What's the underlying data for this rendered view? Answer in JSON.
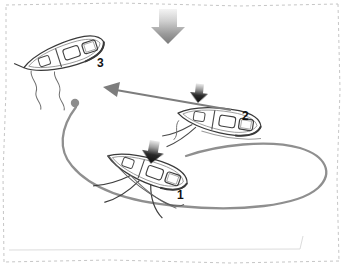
{
  "diagram": {
    "canvas": {
      "width": 344,
      "height": 268,
      "background": "#ffffff"
    },
    "frame": {
      "style": "hand-drawn dashed rectangle",
      "color": "#c9c9c9",
      "dash": "3 3"
    },
    "wind_arrow": {
      "label": "wind-direction",
      "direction": "down",
      "fill_top": "#f2f2f2",
      "fill_bottom": "#7d7d7d",
      "x": 150,
      "y": 8,
      "width": 36,
      "height": 36
    },
    "buoy": {
      "label": "mooring-buoy",
      "color": "#8a8a8a",
      "x": 75,
      "y": 103,
      "radius": 4
    },
    "path": {
      "label": "approach-track",
      "color": "#8f8f8f",
      "width": 2.4,
      "description": "curved track looping from buoy down and around to the right then back to position 1"
    },
    "approach_arrow": {
      "label": "final-approach-arrow",
      "color": "#7a7a7a",
      "from_x": 233,
      "from_y": 111,
      "to_x": 104,
      "to_y": 88
    },
    "boats": [
      {
        "number": "1",
        "name": "boat-position-1",
        "caption_x": 177,
        "caption_y": 190,
        "heading_deg": 20,
        "x": 150,
        "y": 168,
        "has_boom_arrow": true,
        "state": "bearing away / on the run"
      },
      {
        "number": "2",
        "name": "boat-position-2",
        "caption_x": 242,
        "caption_y": 110,
        "heading_deg": 8,
        "x": 220,
        "y": 118,
        "has_boom_arrow": true,
        "state": "rounding up toward the wind"
      },
      {
        "number": "3",
        "name": "boat-position-3",
        "caption_x": 97,
        "caption_y": 57,
        "heading_deg": -22,
        "x": 65,
        "y": 78,
        "has_boom_arrow": false,
        "state": "head to wind, stopped at the buoy"
      }
    ],
    "colors": {
      "outline": "#3a3a3a",
      "hull_shade": "#9a9a9a",
      "path": "#8f8f8f",
      "arrow_black": "#161616",
      "frame": "#c9c9c9"
    }
  }
}
